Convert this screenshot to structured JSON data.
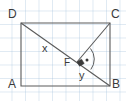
{
  "figure": {
    "background_color": "#ffffff",
    "grid_color": "#96b9d7",
    "stroke_color": "#5a5a5a",
    "text_color": "#3a3a3a",
    "vertices": [
      {
        "name": "A",
        "label": "A",
        "x": 21,
        "y": 86,
        "label_x": 8,
        "label_y": 78
      },
      {
        "name": "B",
        "label": "B",
        "x": 110,
        "y": 86,
        "label_x": 112,
        "label_y": 78
      },
      {
        "name": "C",
        "label": "C",
        "x": 110,
        "y": 23,
        "label_x": 112,
        "label_y": 8
      },
      {
        "name": "D",
        "label": "D",
        "x": 21,
        "y": 23,
        "label_x": 8,
        "label_y": 8
      }
    ],
    "points": [
      {
        "name": "F",
        "label": "F",
        "x": 77,
        "y": 62,
        "label_x": 64,
        "label_y": 63
      }
    ],
    "segments": [
      {
        "name": "side-AB",
        "from": "A",
        "to": "B"
      },
      {
        "name": "side-BC",
        "from": "B",
        "to": "C"
      },
      {
        "name": "side-CD",
        "from": "C",
        "to": "D"
      },
      {
        "name": "side-DA",
        "from": "D",
        "to": "A"
      },
      {
        "name": "diagonal-DB",
        "from": "D",
        "to": "B"
      },
      {
        "name": "segment-CF",
        "from": "C",
        "to": "F"
      }
    ],
    "segment_labels": [
      {
        "name": "label-x",
        "label": "x",
        "x": 44,
        "y": 48
      },
      {
        "name": "label-y",
        "label": "y",
        "x": 80,
        "y": 74
      }
    ],
    "markers": [
      {
        "name": "right-angle-marker",
        "at": "F",
        "type": "right-angle-square",
        "filled": true
      },
      {
        "name": "angle-arc-marker",
        "at": "F",
        "type": "arc-with-dot"
      }
    ]
  }
}
